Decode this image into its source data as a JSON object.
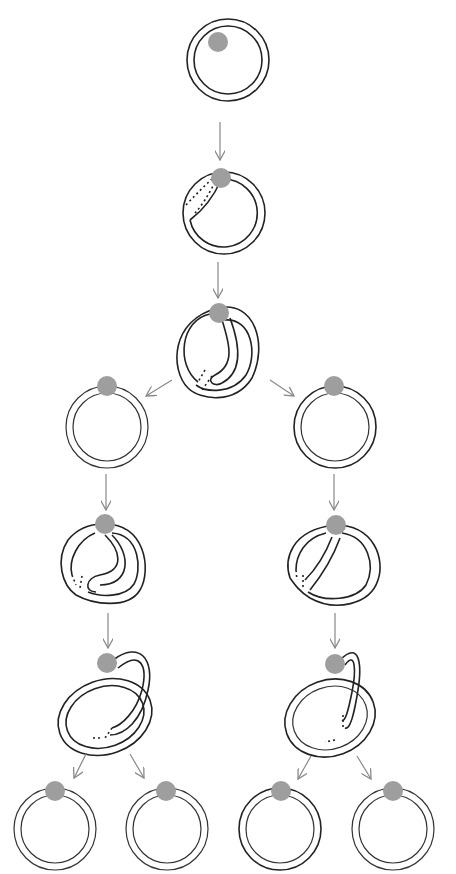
{
  "diagram": {
    "type": "tree",
    "colors": {
      "stroke": "#222222",
      "bead": "#9e9e9e",
      "arrow": "#888888",
      "background": "#ffffff"
    },
    "nodes": [
      {
        "id": "n1",
        "label": "",
        "shape": "plain-ring",
        "cx": 228,
        "cy": 60
      },
      {
        "id": "n2",
        "label": "",
        "shape": "ring-with-small-fold",
        "cx": 222,
        "cy": 213
      },
      {
        "id": "n3",
        "label": "",
        "shape": "ring-with-deep-fold",
        "cx": 222,
        "cy": 345
      },
      {
        "id": "n4",
        "label": "",
        "shape": "plain-ring",
        "cx": 107,
        "cy": 427
      },
      {
        "id": "n5",
        "label": "",
        "shape": "plain-ring",
        "cx": 335,
        "cy": 427
      },
      {
        "id": "n6",
        "label": "",
        "shape": "ring-with-s-fold",
        "cx": 103,
        "cy": 567
      },
      {
        "id": "n7",
        "label": "",
        "shape": "ring-with-fold",
        "cx": 335,
        "cy": 567
      },
      {
        "id": "n8",
        "label": "",
        "shape": "twisted-loop",
        "cx": 105,
        "cy": 712
      },
      {
        "id": "n9",
        "label": "",
        "shape": "twisted-loop",
        "cx": 330,
        "cy": 712
      },
      {
        "id": "n10",
        "label": "",
        "shape": "plain-ring",
        "cx": 55,
        "cy": 829
      },
      {
        "id": "n11",
        "label": "",
        "shape": "plain-ring",
        "cx": 167,
        "cy": 829
      },
      {
        "id": "n12",
        "label": "",
        "shape": "plain-ring",
        "cx": 280,
        "cy": 829
      },
      {
        "id": "n13",
        "label": "",
        "shape": "plain-ring",
        "cx": 393,
        "cy": 829
      }
    ],
    "edges": [
      {
        "from": "n1",
        "to": "n2"
      },
      {
        "from": "n2",
        "to": "n3"
      },
      {
        "from": "n3",
        "to": "n4"
      },
      {
        "from": "n3",
        "to": "n5"
      },
      {
        "from": "n4",
        "to": "n6"
      },
      {
        "from": "n5",
        "to": "n7"
      },
      {
        "from": "n6",
        "to": "n8"
      },
      {
        "from": "n7",
        "to": "n9"
      },
      {
        "from": "n8",
        "to": "n10"
      },
      {
        "from": "n8",
        "to": "n11"
      },
      {
        "from": "n9",
        "to": "n12"
      },
      {
        "from": "n9",
        "to": "n13"
      }
    ]
  }
}
